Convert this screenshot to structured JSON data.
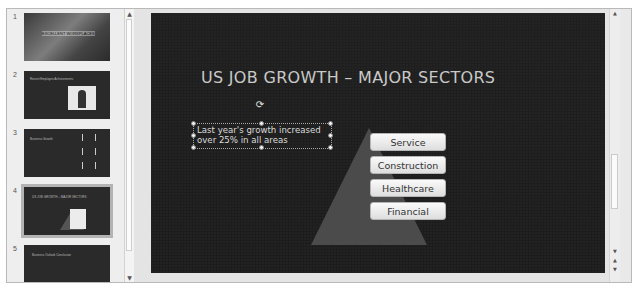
{
  "thumbnails": [
    {
      "number": "1",
      "title": "EXCELLENT WORKPLACES",
      "selected": false
    },
    {
      "number": "2",
      "title": "Recent Employee Achievements",
      "selected": false
    },
    {
      "number": "3",
      "title": "Business Growth",
      "selected": false
    },
    {
      "number": "4",
      "title": "US JOB GROWTH – MAJOR SECTORS",
      "selected": true
    },
    {
      "number": "5",
      "title": "Business Outlook Conclusion",
      "selected": false
    }
  ],
  "slide": {
    "title": "US JOB GROWTH – MAJOR SECTORS",
    "textbox": "Last year's growth increased\nover 25% in all areas",
    "pyramid": {
      "items": [
        "Service",
        "Construction",
        "Healthcare",
        "Financial"
      ],
      "shape_color": "#4b4b4b"
    }
  },
  "icons": {
    "rotate": "⟳",
    "scroll_up": "▲",
    "scroll_down": "▼",
    "prev_slide": "▲",
    "next_slide": "▼"
  },
  "colors": {
    "slide_bg": "#1e1e1e",
    "title_text": "#c9c9c9",
    "pyramid_box": "#f2f2f2"
  }
}
